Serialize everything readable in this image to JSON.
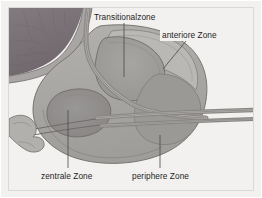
{
  "figure": {
    "background_color": "#f2f1ef",
    "frame_color": "#d9d8d6",
    "labels": [
      {
        "id": "transitionalzone",
        "text": "Transitionalzone",
        "x": 94,
        "y": 13
      },
      {
        "id": "anteriore_zone",
        "text": "anteriore Zone",
        "x": 162,
        "y": 31
      },
      {
        "id": "zentrale_zone",
        "text": "zentrale Zone",
        "x": 41,
        "y": 172
      },
      {
        "id": "periphere_zone",
        "text": "periphere Zone",
        "x": 132,
        "y": 172
      }
    ],
    "leaders": [
      {
        "id": "leader-transitionalzone",
        "from": [
          124,
          23
        ],
        "to": [
          124,
          77
        ]
      },
      {
        "id": "leader-anteriore-zone",
        "from": [
          186,
          41
        ],
        "to": [
          163,
          69
        ]
      },
      {
        "id": "leader-zentrale-zone",
        "from": [
          68,
          168
        ],
        "to": [
          68,
          110
        ]
      },
      {
        "id": "leader-periphere-zone",
        "from": [
          160,
          168
        ],
        "to": [
          160,
          135
        ]
      }
    ],
    "regions": [
      {
        "id": "bladder",
        "name": "Harnblase",
        "color": "#7d7479"
      },
      {
        "id": "peripheral_zone",
        "name": "periphere Zone",
        "color": "#a9a8a4"
      },
      {
        "id": "central_zone",
        "name": "zentrale Zone",
        "color": "#918f8e"
      },
      {
        "id": "transitional_zone",
        "name": "Transitionalzone",
        "color": "#9d9c99"
      },
      {
        "id": "anterior_zone",
        "name": "anteriore Zone",
        "color": "#b9b8b4"
      },
      {
        "id": "urethra",
        "name": "Urethra",
        "color": "#8d8a88"
      },
      {
        "id": "ejaculatory_duct",
        "name": "Ductus ejaculatorius",
        "color": "#8a8784"
      },
      {
        "id": "seminal_vesicle",
        "name": "Samenblase",
        "color": "#b2b0ad"
      },
      {
        "id": "capsule_outline",
        "name": "Kapsel",
        "color": "#6e6b69"
      }
    ]
  }
}
